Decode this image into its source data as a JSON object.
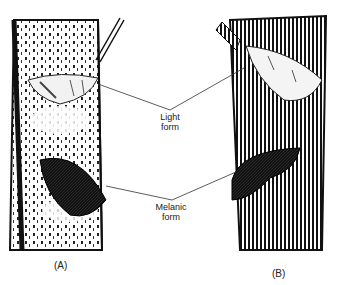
{
  "figure": {
    "labels": {
      "light_line1": "Light",
      "light_line2": "form",
      "melanic_line1": "Melanic",
      "melanic_line2": "form"
    },
    "panels": [
      {
        "id": "A",
        "label": "(A)",
        "description": "Light, lichen-covered tree trunk"
      },
      {
        "id": "B",
        "label": "(B)",
        "description": "Dark, soot-covered tree trunk"
      }
    ]
  }
}
